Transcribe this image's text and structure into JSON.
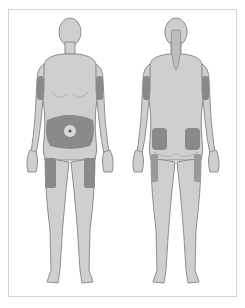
{
  "figure": {
    "views": [
      {
        "label": "front-view"
      },
      {
        "label": "back-view"
      }
    ],
    "colors": {
      "background": "#ffffff",
      "frame_border": "#d4d4d4",
      "body_fill": "#cfcfcf",
      "body_outline": "#8e8e8e",
      "injection_site": "#8a8a8a",
      "navel_ring": "#d8d8d8"
    },
    "injection_sites": [
      {
        "view": "front",
        "region": "upper-arm-right"
      },
      {
        "view": "front",
        "region": "upper-arm-left"
      },
      {
        "view": "front",
        "region": "abdomen"
      },
      {
        "view": "front",
        "region": "thigh-right"
      },
      {
        "view": "front",
        "region": "thigh-left"
      },
      {
        "view": "back",
        "region": "upper-arm-left"
      },
      {
        "view": "back",
        "region": "upper-arm-right"
      },
      {
        "view": "back",
        "region": "buttock-left"
      },
      {
        "view": "back",
        "region": "buttock-right"
      },
      {
        "view": "back",
        "region": "thigh-outer-left"
      },
      {
        "view": "back",
        "region": "thigh-outer-right"
      }
    ]
  }
}
